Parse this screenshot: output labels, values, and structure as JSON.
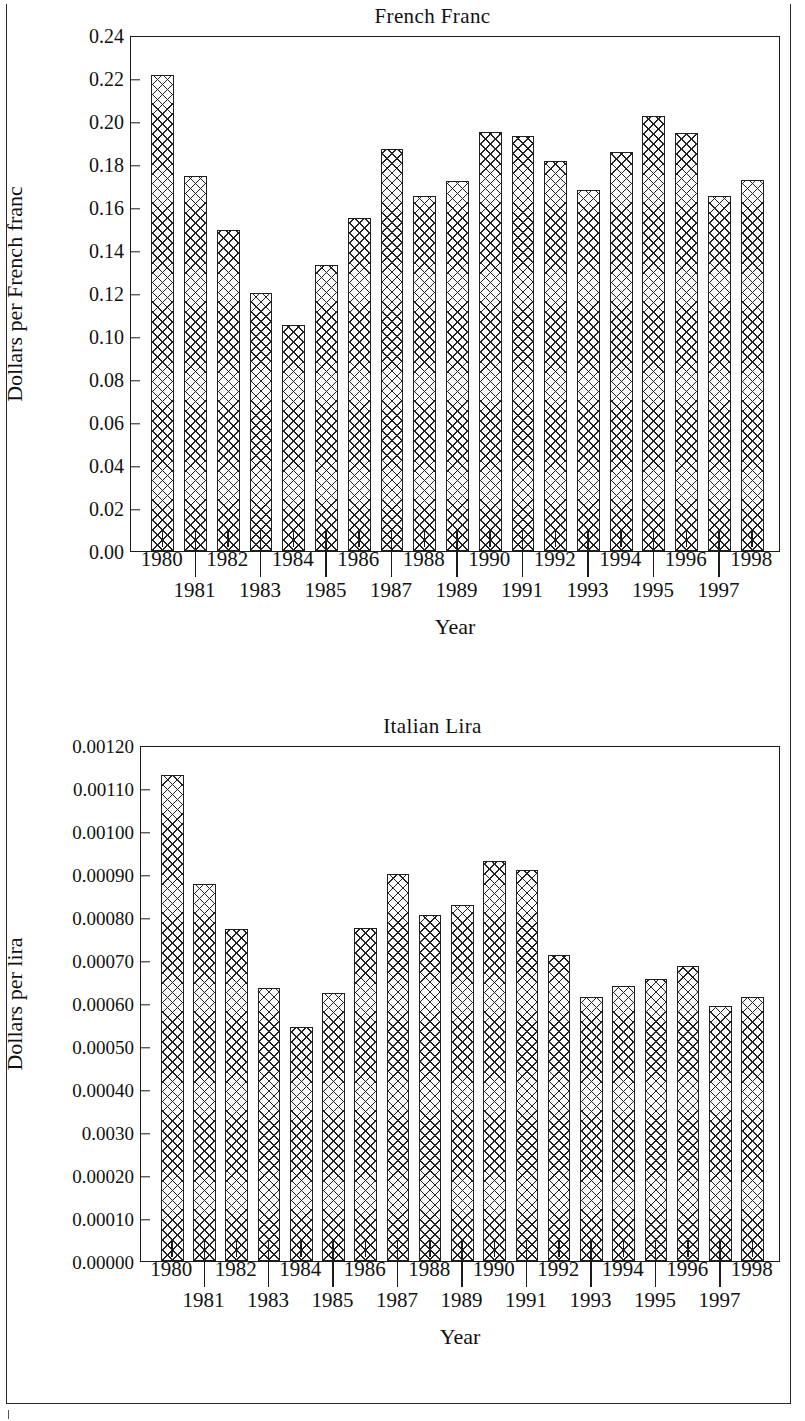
{
  "chart_data": [
    {
      "type": "bar",
      "title": "French Franc",
      "xlabel": "Year",
      "ylabel": "Dollars per French franc",
      "ylim": [
        0.0,
        0.24
      ],
      "grid": false,
      "legend": null,
      "categories": [
        "1980",
        "1981",
        "1982",
        "1983",
        "1984",
        "1985",
        "1986",
        "1987",
        "1988",
        "1989",
        "1990",
        "1991",
        "1992",
        "1993",
        "1994",
        "1995",
        "1996",
        "1997",
        "1998"
      ],
      "values": [
        0.2215,
        0.1745,
        0.1492,
        0.1199,
        0.105,
        0.1329,
        0.1549,
        0.1872,
        0.165,
        0.1722,
        0.1947,
        0.1928,
        0.1813,
        0.168,
        0.1857,
        0.2025,
        0.1943,
        0.1651,
        0.1727
      ],
      "ytick_labels": [
        "0.24",
        "0.22",
        "0.20",
        "0.18",
        "0.16",
        "0.14",
        "0.12",
        "0.10",
        "0.08",
        "0.06",
        "0.04",
        "0.02",
        "0.00"
      ],
      "ytick_values": [
        0.24,
        0.22,
        0.2,
        0.18,
        0.16,
        0.14,
        0.12,
        0.1,
        0.08,
        0.06,
        0.04,
        0.02,
        0.0
      ],
      "xtick_labels_top": [
        "1980",
        "1982",
        "1984",
        "1986",
        "1988",
        "1990",
        "1992",
        "1994",
        "1996",
        "1998"
      ],
      "xtick_labels_bottom": [
        "1981",
        "1983",
        "1985",
        "1987",
        "1989",
        "1991",
        "1993",
        "1995",
        "1997"
      ]
    },
    {
      "type": "bar",
      "title": "Italian Lira",
      "xlabel": "Year",
      "ylabel": "Dollars per lira",
      "ylim": [
        0.0,
        0.0012
      ],
      "grid": false,
      "legend": null,
      "categories": [
        "1980",
        "1981",
        "1982",
        "1983",
        "1984",
        "1985",
        "1986",
        "1987",
        "1988",
        "1989",
        "1990",
        "1991",
        "1992",
        "1993",
        "1994",
        "1995",
        "1996",
        "1997",
        "1998"
      ],
      "values": [
        0.00113,
        0.000877,
        0.000771,
        0.000635,
        0.000544,
        0.000623,
        0.000774,
        0.0009,
        0.000805,
        0.000828,
        0.00093,
        0.00091,
        0.000711,
        0.000613,
        0.000639,
        0.000657,
        0.000687,
        0.000593,
        0.000615
      ],
      "ytick_labels": [
        "0.00120",
        "0.00110",
        "0.00100",
        "0.00090",
        "0.00080",
        "0.00070",
        "0.00060",
        "0.00050",
        "0.00040",
        "0.0030",
        "0.00020",
        "0.00010",
        "0.00000"
      ],
      "ytick_values": [
        0.0012,
        0.0011,
        0.001,
        0.0009,
        0.0008,
        0.0007,
        0.0006,
        0.0005,
        0.0004,
        0.0003,
        0.0002,
        0.0001,
        0.0
      ],
      "xtick_labels_top": [
        "1980",
        "1982",
        "1984",
        "1986",
        "1988",
        "1990",
        "1992",
        "1994",
        "1996",
        "1998"
      ],
      "xtick_labels_bottom": [
        "1981",
        "1983",
        "1985",
        "1987",
        "1989",
        "1991",
        "1993",
        "1995",
        "1997"
      ]
    }
  ],
  "figures": {
    "franc": {
      "title": "French Franc",
      "ylabel": "Dollars per French franc",
      "xlabel": "Year"
    },
    "lira": {
      "title": "Italian Lira",
      "ylabel": "Dollars per lira",
      "xlabel": "Year"
    }
  },
  "style": {
    "ink": "#1b1b1b",
    "paper": "#ffffff",
    "bar_fill": "#fdfdfd",
    "bar_hatch": "#222222"
  }
}
